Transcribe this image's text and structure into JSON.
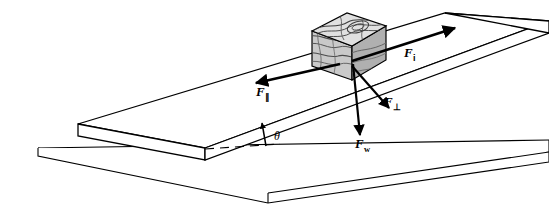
{
  "figure": {
    "background_color": "#ffffff",
    "line_color": "#000000"
  },
  "labels": {
    "force_incline_up": {
      "symbol": "F",
      "subscript": "i",
      "name": "F-sub-i"
    },
    "force_parallel": {
      "symbol": "F",
      "subscript": "∥",
      "name": "F-parallel"
    },
    "force_perpendicular": {
      "symbol": "F",
      "subscript": "⊥",
      "name": "F-perpendicular"
    },
    "force_weight": {
      "symbol": "F",
      "subscript": "w",
      "name": "F-weight"
    },
    "angle": {
      "symbol": "θ",
      "name": "theta"
    }
  },
  "objects": {
    "ground_plane": {
      "label": "horizontal ground surface",
      "fill": "#ffffff"
    },
    "ramp": {
      "label": "inclined ramp",
      "fill": "#ffffff"
    },
    "block": {
      "label": "textured block on ramp",
      "fill": "#cfcfcf",
      "top_fill": "#e6e6e6",
      "side_fill": "#b8b8b8"
    },
    "dashed_reference": {
      "label": "horizontal dashed reference line"
    }
  },
  "vectors": [
    {
      "name": "F-sub-i",
      "direction": "up the incline (to the upper right)"
    },
    {
      "name": "F-parallel",
      "direction": "down the incline (to the lower left)"
    },
    {
      "name": "F-perpendicular",
      "direction": "perpendicular into the incline surface"
    },
    {
      "name": "F-weight",
      "direction": "straight down (vertical)"
    },
    {
      "name": "theta-indicator",
      "direction": "upward to the incline line"
    }
  ]
}
